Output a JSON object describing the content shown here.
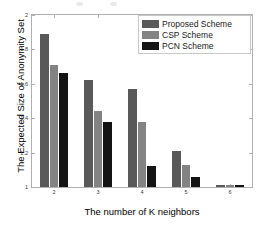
{
  "chart_data": {
    "type": "bar",
    "title": "",
    "xlabel": "The number of K neighbors",
    "ylabel": "The Expected Size of Anonymity Set",
    "categories": [
      "2",
      "3",
      "4",
      "5",
      "6"
    ],
    "xtick_labels": [
      "2",
      "3",
      "4",
      "5",
      "6"
    ],
    "ytick_labels": [
      "1",
      "1.2",
      "1.4",
      "1.6",
      "1.8",
      "2"
    ],
    "ytick_values": [
      1,
      1.2,
      1.4,
      1.6,
      1.8,
      2
    ],
    "ylim": [
      1,
      2
    ],
    "grid": false,
    "legend_position": "top-right",
    "series": [
      {
        "name": "Proposed Scheme",
        "color": "#595959",
        "values": [
          1.89,
          1.62,
          1.57,
          1.21,
          1.01
        ]
      },
      {
        "name": "CSP Scheme",
        "color": "#838383",
        "values": [
          1.71,
          1.44,
          1.38,
          1.13,
          1.01
        ]
      },
      {
        "name": "PCN Scheme",
        "color": "#141414",
        "values": [
          1.66,
          1.38,
          1.12,
          1.06,
          1.01
        ]
      }
    ]
  },
  "legend": {
    "entries": [
      {
        "label": "Proposed Scheme",
        "color": "#595959"
      },
      {
        "label": "CSP Scheme",
        "color": "#838383"
      },
      {
        "label": "PCN Scheme",
        "color": "#141414"
      }
    ]
  },
  "axes": {
    "box_color": "#b0b0b0",
    "tick_color": "#3a3a3a"
  }
}
